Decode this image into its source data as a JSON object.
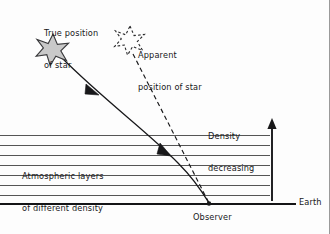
{
  "figure": {
    "type": "diagram",
    "background_color": "#fdfdfd",
    "ink_color": "#18181a",
    "layer_line_color": "#555555",
    "star_fill_color": "#c9c9c9"
  },
  "labels": {
    "true_position": {
      "line1": "True position",
      "line2": "of star"
    },
    "apparent_position": {
      "line1": "Apparent",
      "line2": "position of star"
    },
    "atmospheric_layers": {
      "line1": "Atmospheric layers",
      "line2": "of different density"
    },
    "density_decreasing": {
      "line1": "Density",
      "line2": "decreasing"
    },
    "observer": "Observer",
    "earth": "Earth"
  },
  "icons": {
    "true_star": "six-pointed-star-filled",
    "apparent_star": "six-pointed-star-dashed-outline",
    "density_arrow": "up-arrow",
    "ray_arrow": "arrowhead",
    "observer_marker": "dot"
  },
  "geometry": {
    "true_star_center": {
      "x": 53,
      "y": 49
    },
    "apparent_star_center": {
      "x": 130,
      "y": 40
    },
    "observer_point": {
      "x": 209,
      "y": 204
    },
    "earth_line": {
      "x1": 0,
      "x2": 296,
      "y": 204
    },
    "density_arrow": {
      "x": 272,
      "y_top": 120,
      "y_bottom": 201
    },
    "atmospheric_layer_count": 8,
    "layer_lines_y": [
      135,
      145,
      155,
      165,
      175,
      185,
      195,
      204
    ],
    "layer_lines_x_extent": {
      "x1": 0,
      "x2": 270
    },
    "refracted_ray": "curved solid path from true star to observer, bending toward vertical near the ground",
    "straight_sightline": "dashed straight path from apparent star to observer"
  }
}
